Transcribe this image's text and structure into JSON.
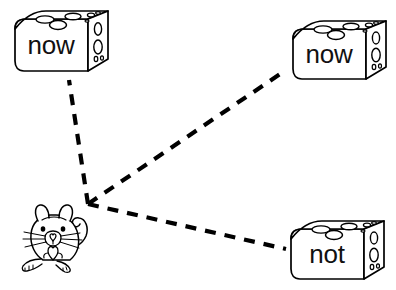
{
  "activity": {
    "type": "word-matching-worksheet",
    "background_color": "#ffffff",
    "ink_color": "#000000",
    "description": "A mouse connected by dashed lines to three cheese blocks"
  },
  "mouse": {
    "name": "mouse",
    "x": 18,
    "y": 203,
    "width": 80,
    "height": 72,
    "features": [
      "ears",
      "eyes",
      "nose",
      "whiskers",
      "paws",
      "curled-tail"
    ]
  },
  "dash_origin": {
    "x": 88,
    "y": 204
  },
  "cheese_blocks": [
    {
      "id": "cheese-top-left",
      "label": "now",
      "x": 12,
      "y": 9,
      "width": 98,
      "height": 66,
      "line_end": {
        "x": 70,
        "y": 80
      }
    },
    {
      "id": "cheese-top-right",
      "label": "now",
      "x": 290,
      "y": 19,
      "width": 98,
      "height": 64,
      "line_end": {
        "x": 283,
        "y": 72
      }
    },
    {
      "id": "cheese-bottom-right",
      "label": "not",
      "x": 288,
      "y": 219,
      "width": 98,
      "height": 64,
      "line_end": {
        "x": 286,
        "y": 249
      }
    }
  ],
  "connector_lines": [
    {
      "id": "line-to-top-left",
      "from": "mouse",
      "to": "cheese-top-left",
      "style": "dashed"
    },
    {
      "id": "line-to-top-right",
      "from": "mouse",
      "to": "cheese-top-right",
      "style": "dashed"
    },
    {
      "id": "line-to-bottom-right",
      "from": "mouse",
      "to": "cheese-bottom-right",
      "style": "dashed"
    }
  ]
}
